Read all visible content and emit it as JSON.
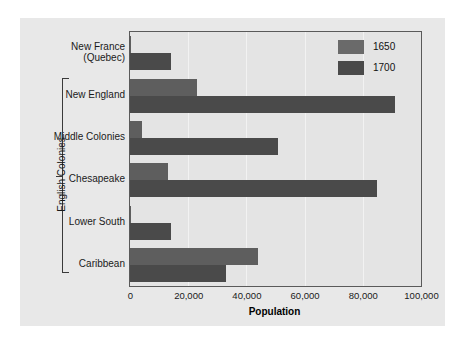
{
  "chart_data": {
    "type": "bar",
    "orientation": "horizontal",
    "title": "",
    "xlabel": "Population",
    "ylabel": "",
    "xlim": [
      0,
      100000
    ],
    "xticks": [
      "0",
      "20,000",
      "40,000",
      "60,000",
      "80,000",
      "100,000"
    ],
    "xtick_values": [
      0,
      20000,
      40000,
      60000,
      80000,
      100000
    ],
    "grid": true,
    "legend_position": "top-right",
    "categories": [
      "New France\n(Quebec)",
      "New England",
      "Middle Colonies",
      "Chesapeake",
      "Lower South",
      "Caribbean"
    ],
    "category_labels": [
      {
        "line1": "New France",
        "line2": "(Quebec)"
      },
      {
        "line1": "New England",
        "line2": ""
      },
      {
        "line1": "Middle Colonies",
        "line2": ""
      },
      {
        "line1": "Chesapeake",
        "line2": ""
      },
      {
        "line1": "Lower South",
        "line2": ""
      },
      {
        "line1": "Caribbean",
        "line2": ""
      }
    ],
    "series": [
      {
        "name": "1650",
        "color": "#5e5e5e",
        "values": [
          500,
          23000,
          4000,
          13000,
          400,
          44000
        ]
      },
      {
        "name": "1700",
        "color": "#4a4a4a",
        "values": [
          14000,
          91000,
          51000,
          85000,
          14000,
          33000
        ]
      }
    ],
    "group_bracket": {
      "label": "English Colonies",
      "spans_categories": [
        "New England",
        "Middle Colonies",
        "Chesapeake",
        "Lower South",
        "Caribbean"
      ]
    }
  },
  "legend": {
    "items": [
      {
        "label": "1650",
        "color": "#6a6a6a"
      },
      {
        "label": "1700",
        "color": "#4a4a4a"
      }
    ]
  },
  "axis": {
    "xlabel": "Population"
  },
  "colors": {
    "panel_background": "#e8e8e8",
    "plot_background": "#e4e4e4",
    "plot_border": "#5a5a5a",
    "gridline": "#f2f2f2",
    "series_1650": "#5e5e5e",
    "series_1700": "#4a4a4a",
    "text": "#1a1a1a"
  }
}
